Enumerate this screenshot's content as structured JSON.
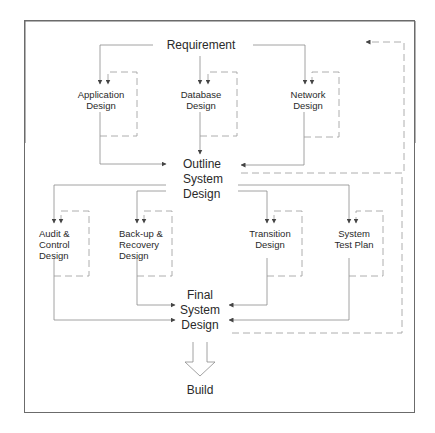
{
  "diagram": {
    "type": "system design process flow",
    "colors": {
      "line": "#8a8a8a",
      "dashed": "#9a9a9a",
      "frame": "#666666",
      "text": "#2a2a2a",
      "background": "#ffffff"
    },
    "nodes": {
      "requirement": "Requirement",
      "application_design": "Application\nDesign",
      "database_design": "Database\nDesign",
      "network_design": "Network\nDesign",
      "outline_system_design": "Outline\nSystem\nDesign",
      "audit_control_design": "Audit &\nControl\nDesign",
      "backup_recovery_design": "Back-up &\nRecovery\nDesign",
      "transition_design": "Transition\nDesign",
      "system_test_plan": "System\nTest Plan",
      "final_system_design": "Final\nSystem\nDesign",
      "build": "Build"
    },
    "edges": [
      {
        "from": "Requirement",
        "to": "Application Design",
        "style": "solid"
      },
      {
        "from": "Requirement",
        "to": "Database Design",
        "style": "solid"
      },
      {
        "from": "Requirement",
        "to": "Network Design",
        "style": "solid"
      },
      {
        "from": "Application Design",
        "to": "Application Design",
        "style": "dashed",
        "note": "iteration loop"
      },
      {
        "from": "Database Design",
        "to": "Database Design",
        "style": "dashed",
        "note": "iteration loop"
      },
      {
        "from": "Network Design",
        "to": "Network Design",
        "style": "dashed",
        "note": "iteration loop"
      },
      {
        "from": "Application Design",
        "to": "Outline System Design",
        "style": "solid"
      },
      {
        "from": "Database Design",
        "to": "Outline System Design",
        "style": "solid"
      },
      {
        "from": "Network Design",
        "to": "Outline System Design",
        "style": "solid"
      },
      {
        "from": "Outline System Design",
        "to": "Requirement",
        "style": "dashed",
        "note": "feedback"
      },
      {
        "from": "Outline System Design",
        "to": "Audit & Control Design",
        "style": "solid"
      },
      {
        "from": "Outline System Design",
        "to": "Back-up & Recovery Design",
        "style": "solid"
      },
      {
        "from": "Outline System Design",
        "to": "Transition Design",
        "style": "solid"
      },
      {
        "from": "Outline System Design",
        "to": "System Test Plan",
        "style": "solid"
      },
      {
        "from": "Audit & Control Design",
        "to": "Audit & Control Design",
        "style": "dashed",
        "note": "iteration loop"
      },
      {
        "from": "Back-up & Recovery Design",
        "to": "Back-up & Recovery Design",
        "style": "dashed",
        "note": "iteration loop"
      },
      {
        "from": "Transition Design",
        "to": "Transition Design",
        "style": "dashed",
        "note": "iteration loop"
      },
      {
        "from": "System Test Plan",
        "to": "System Test Plan",
        "style": "dashed",
        "note": "iteration loop"
      },
      {
        "from": "Audit & Control Design",
        "to": "Final System Design",
        "style": "solid"
      },
      {
        "from": "Back-up & Recovery Design",
        "to": "Final System Design",
        "style": "solid"
      },
      {
        "from": "Transition Design",
        "to": "Final System Design",
        "style": "solid"
      },
      {
        "from": "System Test Plan",
        "to": "Final System Design",
        "style": "solid"
      },
      {
        "from": "Final System Design",
        "to": "Requirement",
        "style": "dashed",
        "note": "feedback"
      },
      {
        "from": "Final System Design",
        "to": "Build",
        "style": "block-arrow"
      }
    ]
  }
}
